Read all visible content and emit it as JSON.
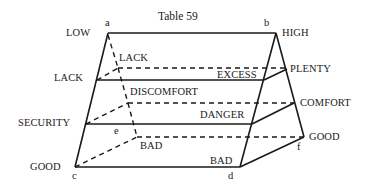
{
  "title": "Table 59",
  "points": {
    "a": "a",
    "b": "b",
    "c": "c",
    "d": "d",
    "e": "e",
    "f": "f"
  },
  "left_labels": {
    "low": "LOW",
    "lack": "LACK",
    "security": "SECURITY",
    "good": "GOOD"
  },
  "right_labels": {
    "high": "HIGH",
    "plenty": "PLENTY",
    "comfort": "COMFORT",
    "good": "GOOD"
  },
  "inner_labels": {
    "lack": "LACK",
    "excess": "EXCESS",
    "discomfort": "DISCOMFORT",
    "danger": "DANGER",
    "bad_back": "BAD",
    "bad_front": "BAD"
  },
  "colors": {
    "line": "#1a1a1a",
    "background": "#ffffff"
  }
}
